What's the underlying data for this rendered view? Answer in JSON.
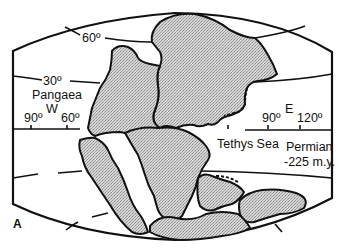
{
  "map": {
    "title": "Pangaea",
    "panel_label": "A",
    "period": "Permian",
    "age": "-225 m.y.",
    "sea_label": "Tethys Sea",
    "hemisphere_west": "W",
    "hemisphere_east": "E",
    "latitudes": [
      "60º",
      "30º"
    ],
    "longitudes_west": [
      "90º",
      "60º"
    ],
    "longitudes_east": [
      "90º",
      "120º"
    ],
    "colors": {
      "ink": "#111111",
      "land_fill": "#cfcfcf",
      "background": "#ffffff"
    }
  }
}
